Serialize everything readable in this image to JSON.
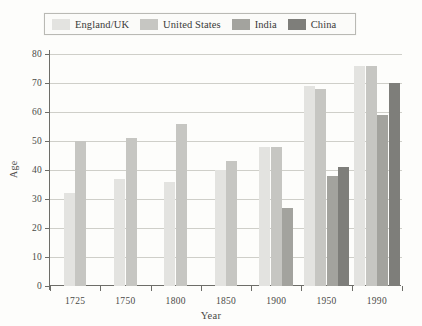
{
  "legend": {
    "entries": [
      {
        "label": "England/UK",
        "color": "#e3e3e0"
      },
      {
        "label": "United States",
        "color": "#c6c6c2"
      },
      {
        "label": "India",
        "color": "#a3a39e"
      },
      {
        "label": "China",
        "color": "#7e7e7a"
      }
    ]
  },
  "axes": {
    "y_label": "Age",
    "x_label": "Year",
    "y_ticks": [
      "0",
      "10",
      "20",
      "30",
      "40",
      "50",
      "60",
      "70",
      "80"
    ]
  },
  "chart_data": {
    "type": "bar",
    "title": "",
    "xlabel": "Year",
    "ylabel": "Age",
    "ylim": [
      0,
      80
    ],
    "ytick_step": 10,
    "grid": true,
    "legend_position": "top",
    "categories": [
      "1725",
      "1750",
      "1800",
      "1850",
      "1900",
      "1950",
      "1990"
    ],
    "series": [
      {
        "name": "England/UK",
        "color": "#e3e3e0",
        "values": [
          32,
          37,
          36,
          40,
          48,
          69,
          76
        ]
      },
      {
        "name": "United States",
        "color": "#c6c6c2",
        "values": [
          50,
          51,
          56,
          43,
          48,
          68,
          76
        ]
      },
      {
        "name": "India",
        "color": "#a3a39e",
        "values": [
          null,
          null,
          null,
          null,
          27,
          38,
          59
        ]
      },
      {
        "name": "China",
        "color": "#7e7e7a",
        "values": [
          null,
          null,
          null,
          null,
          null,
          41,
          70
        ]
      }
    ]
  }
}
